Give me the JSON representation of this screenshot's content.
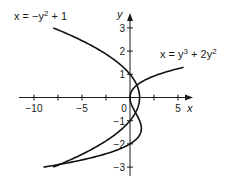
{
  "chart_data": {
    "type": "line",
    "title": "",
    "xlabel": "x",
    "ylabel": "y",
    "xlim": [
      -11,
      6
    ],
    "ylim": [
      -3.5,
      3.4
    ],
    "grid": false,
    "x_ticks": [
      -10,
      -7.5,
      -5,
      -2.5,
      0,
      2.5,
      5
    ],
    "x_tick_labels": [
      {
        "value": -10,
        "label": "−10"
      },
      {
        "value": -5,
        "label": "−5"
      },
      {
        "value": 0,
        "label": "0"
      },
      {
        "value": 5,
        "label": "5"
      }
    ],
    "y_ticks": [
      -3,
      -2,
      -1,
      1,
      2,
      3
    ],
    "y_tick_labels": [
      {
        "value": 3,
        "label": "3"
      },
      {
        "value": 2,
        "label": "2"
      },
      {
        "value": 1,
        "label": "1"
      },
      {
        "value": -1,
        "label": "−1"
      },
      {
        "value": -2,
        "label": "−2"
      },
      {
        "value": -3,
        "label": "−3"
      }
    ],
    "series": [
      {
        "name": "x = −y² + 1",
        "equation": "x = -y^2 + 1",
        "y_range": [
          -3,
          3
        ],
        "points": [
          [
            -8,
            3
          ],
          [
            -5.25,
            2.5
          ],
          [
            -3,
            2
          ],
          [
            -1.25,
            1.5
          ],
          [
            0,
            1
          ],
          [
            0.75,
            0.5
          ],
          [
            1,
            0
          ],
          [
            0.75,
            -0.5
          ],
          [
            0,
            -1
          ],
          [
            -1.25,
            -1.5
          ],
          [
            -3,
            -2
          ],
          [
            -5.25,
            -2.5
          ],
          [
            -8,
            -3
          ]
        ]
      },
      {
        "name": "x = y³ + 2y²",
        "equation": "x = y^3 + 2y^2",
        "y_range": [
          -3,
          1.3
        ],
        "points": [
          [
            -9,
            -3
          ],
          [
            -3.125,
            -2.5
          ],
          [
            0,
            -2
          ],
          [
            1.125,
            -1.5
          ],
          [
            1,
            -1
          ],
          [
            0.375,
            -0.5
          ],
          [
            0,
            0
          ],
          [
            0.625,
            0.5
          ],
          [
            3,
            1
          ],
          [
            5.577,
            1.3
          ]
        ]
      }
    ],
    "annotations": [
      {
        "text_main": "x = −y",
        "sup": "2",
        "rest": " + 1",
        "target": "series 0"
      },
      {
        "text_main": "x = y",
        "sup": "3",
        "rest": " + 2y",
        "sup2": "2",
        "target": "series 1"
      }
    ]
  },
  "labels": {
    "x_axis": "x",
    "y_axis": "y",
    "eq1": {
      "a": "x = −y",
      "sup": "2",
      "b": " + 1"
    },
    "eq2": {
      "a": "x = y",
      "sup": "3",
      "b": " + 2y",
      "sup2": "2"
    }
  }
}
